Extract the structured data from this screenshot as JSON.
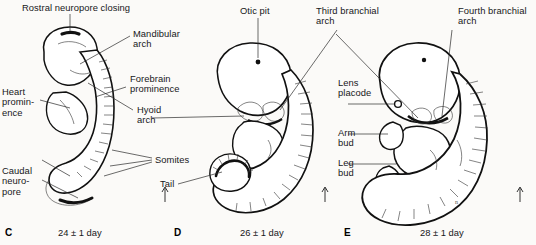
{
  "figure": {
    "background_color": "#fbfaf8",
    "ink_color": "#111111"
  },
  "panels": [
    {
      "letter": "C",
      "caption": "24 ± 1 day",
      "labels": [
        {
          "name": "rostral-neuropore-closing",
          "text": "Rostral neuropore closing"
        },
        {
          "name": "mandibular-arch",
          "text": "Mandibular\narch"
        },
        {
          "name": "forebrain-prominence",
          "text": "Forebrain\nprominence"
        },
        {
          "name": "hyoid-arch",
          "text": "Hyoid\narch"
        },
        {
          "name": "heart-prominence",
          "text": "Heart\npromin-\nence"
        },
        {
          "name": "caudal-neuropore",
          "text": "Caudal\nneuro-\npore"
        },
        {
          "name": "somites",
          "text": "Somites"
        }
      ]
    },
    {
      "letter": "D",
      "caption": "26 ± 1 day",
      "labels": [
        {
          "name": "otic-pit",
          "text": "Otic pit"
        },
        {
          "name": "third-branchial-arch",
          "text": "Third branchial\narch"
        },
        {
          "name": "tail",
          "text": "Tail"
        }
      ]
    },
    {
      "letter": "E",
      "caption": "28 ± 1 day",
      "labels": [
        {
          "name": "fourth-branchial-arch",
          "text": "Fourth branchial\narch"
        },
        {
          "name": "lens-placode",
          "text": "Lens\nplacode"
        },
        {
          "name": "arm-bud",
          "text": "Arm\nbud"
        },
        {
          "name": "leg-bud",
          "text": "Leg\nbud"
        }
      ]
    }
  ]
}
